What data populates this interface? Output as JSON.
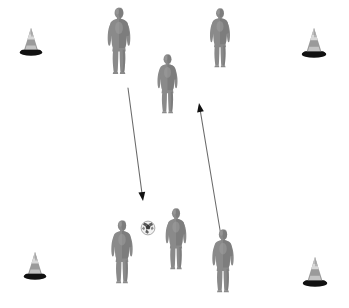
{
  "scene": {
    "title": "Soccer training drill diagram",
    "width": 349,
    "height": 308,
    "background_color": "#ffffff",
    "description": "Overhead-style soccer coaching diagram with seven gray player silhouettes, four marker cones at the corners, one soccer ball and two movement arrows."
  },
  "colors": {
    "background": "#ffffff",
    "player_body": "#8a8a8a",
    "player_shade": "#6f6f6f",
    "player_highlight": "#9e9e9e",
    "cone_body": "#9a9a9a",
    "cone_top": "#d8d8d8",
    "cone_base": "#111111",
    "ball_white": "#f2f2f2",
    "ball_patch": "#3c3c3c",
    "arrow": "#6a6a6a",
    "arrow_head": "#111111"
  },
  "cones": [
    {
      "name": "cone-top-left",
      "label": "Cone",
      "x": 18,
      "y": 26,
      "w": 26,
      "h": 30
    },
    {
      "name": "cone-top-right",
      "label": "Cone",
      "x": 300,
      "y": 26,
      "w": 28,
      "h": 32
    },
    {
      "name": "cone-bottom-left",
      "label": "Cone",
      "x": 22,
      "y": 250,
      "w": 26,
      "h": 30
    },
    {
      "name": "cone-bottom-right",
      "label": "Cone",
      "x": 301,
      "y": 255,
      "w": 28,
      "h": 32
    }
  ],
  "players": [
    {
      "name": "player-top-left",
      "label": "Player",
      "x": 99,
      "y": 6,
      "w": 40,
      "h": 70
    },
    {
      "name": "player-top-right",
      "label": "Player",
      "x": 202,
      "y": 7,
      "w": 36,
      "h": 62
    },
    {
      "name": "player-center",
      "label": "Player",
      "x": 150,
      "y": 53,
      "w": 35,
      "h": 62
    },
    {
      "name": "player-bottom-left",
      "label": "Player",
      "x": 103,
      "y": 219,
      "w": 38,
      "h": 66
    },
    {
      "name": "player-bottom-center",
      "label": "Player",
      "x": 158,
      "y": 207,
      "w": 36,
      "h": 64
    },
    {
      "name": "player-bottom-right",
      "label": "Player",
      "x": 204,
      "y": 228,
      "w": 38,
      "h": 66
    }
  ],
  "ball": {
    "name": "soccer-ball",
    "label": "Soccer ball",
    "cx": 148,
    "cy": 228,
    "r": 8
  },
  "arrows": [
    {
      "name": "arrow-pass-down",
      "label": "Pass / run direction down-right",
      "x1": 128,
      "y1": 88,
      "x2": 143,
      "y2": 201,
      "head": "end"
    },
    {
      "name": "arrow-run-up",
      "label": "Run direction up-left",
      "x1": 221,
      "y1": 236,
      "x2": 199,
      "y2": 103,
      "head": "end"
    }
  ]
}
